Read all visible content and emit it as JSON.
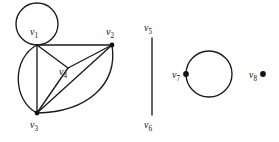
{
  "figure": {
    "background_color": "#ffffff",
    "stroke_color": "#1a1a1a"
  },
  "graph_data": {
    "type": "graph-diagram",
    "layout": "manual",
    "vertex_count": 8,
    "component_count": 4,
    "vertices": [
      {
        "id": "v1",
        "label": "v",
        "subscript": "1",
        "x": 37,
        "y": 45,
        "label_x": 34,
        "label_y": 33,
        "dot": false,
        "self_loop": true
      },
      {
        "id": "v2",
        "label": "v",
        "subscript": "2",
        "x": 112,
        "y": 45,
        "label_x": 110,
        "label_y": 33,
        "dot": true,
        "self_loop": false
      },
      {
        "id": "v3",
        "label": "v",
        "subscript": "3",
        "x": 37,
        "y": 113,
        "label_x": 34,
        "label_y": 126,
        "dot": true,
        "self_loop": false
      },
      {
        "id": "v4",
        "label": "v",
        "subscript": "4",
        "x": 68,
        "y": 68,
        "label_x": 63,
        "label_y": 73,
        "dot": false,
        "self_loop": false
      },
      {
        "id": "v5",
        "label": "v",
        "subscript": "5",
        "x": 152,
        "y": 38,
        "label_x": 148,
        "label_y": 29,
        "dot": false,
        "self_loop": false
      },
      {
        "id": "v6",
        "label": "v",
        "subscript": "6",
        "x": 152,
        "y": 115,
        "label_x": 148,
        "label_y": 126,
        "dot": false,
        "self_loop": false
      },
      {
        "id": "v7",
        "label": "v",
        "subscript": "7",
        "x": 186,
        "y": 74,
        "label_x": 174,
        "label_y": 76,
        "dot": true,
        "self_loop": true
      },
      {
        "id": "v8",
        "label": "v",
        "subscript": "8",
        "x": 261,
        "y": 74,
        "label_x": 250,
        "label_y": 76,
        "dot": true,
        "self_loop": false
      }
    ],
    "edges": [
      {
        "from": "v1",
        "to": "v2",
        "style": "straight"
      },
      {
        "from": "v1",
        "to": "v3",
        "style": "straight"
      },
      {
        "from": "v1",
        "to": "v3",
        "style": "curved-left"
      },
      {
        "from": "v1",
        "to": "v4",
        "style": "straight"
      },
      {
        "from": "v2",
        "to": "v4",
        "style": "straight"
      },
      {
        "from": "v2",
        "to": "v3",
        "style": "straight"
      },
      {
        "from": "v2",
        "to": "v3",
        "style": "curved-right"
      },
      {
        "from": "v3",
        "to": "v4",
        "style": "straight"
      },
      {
        "from": "v5",
        "to": "v6",
        "style": "straight"
      }
    ],
    "self_loops": [
      {
        "at": "v1",
        "cx": 37,
        "cy": 24,
        "r": 21
      },
      {
        "at": "v7",
        "cx": 209,
        "cy": 74,
        "r": 23
      }
    ],
    "isolated_vertices": [
      "v8"
    ],
    "components": [
      {
        "name": "component-1",
        "vertices": [
          "v1",
          "v2",
          "v3",
          "v4"
        ]
      },
      {
        "name": "component-2",
        "vertices": [
          "v5",
          "v6"
        ]
      },
      {
        "name": "component-3",
        "vertices": [
          "v7"
        ]
      },
      {
        "name": "component-4",
        "vertices": [
          "v8"
        ]
      }
    ]
  }
}
